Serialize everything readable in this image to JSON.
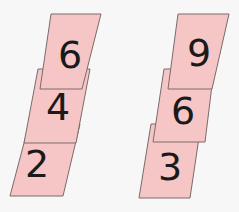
{
  "scene": {
    "description": "Two stacks of three slanted pink cards with handwritten digits",
    "card_color": "#f6c6c6",
    "border_color": "#7a6a6a",
    "background": "#f7f7f7",
    "stacks": [
      {
        "name": "left-stack",
        "cards": [
          {
            "position": "bottom",
            "digit": "2"
          },
          {
            "position": "middle",
            "digit": "4"
          },
          {
            "position": "top",
            "digit": "6"
          }
        ]
      },
      {
        "name": "right-stack",
        "cards": [
          {
            "position": "bottom",
            "digit": "3"
          },
          {
            "position": "middle",
            "digit": "6"
          },
          {
            "position": "top",
            "digit": "9"
          }
        ]
      }
    ]
  }
}
